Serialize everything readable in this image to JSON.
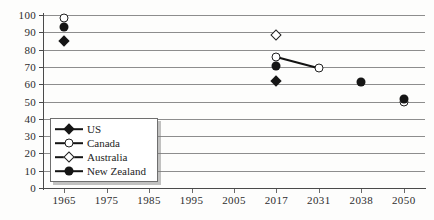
{
  "chart_data": {
    "type": "scatter",
    "title": "",
    "xlabel": "",
    "ylabel": "",
    "grid": true,
    "legend_position": "inside-lower-left",
    "categories": [
      "1965",
      "1975",
      "1985",
      "1995",
      "2005",
      "2017",
      "2031",
      "2038",
      "2050"
    ],
    "ylim": [
      0,
      100
    ],
    "yticks": [
      0,
      10,
      20,
      30,
      40,
      50,
      60,
      70,
      80,
      90,
      100
    ],
    "ytick_labels": [
      "0",
      "10",
      "20",
      "30",
      "40",
      "50",
      "60",
      "70",
      "80",
      "90",
      "100"
    ],
    "series": [
      {
        "name": "US",
        "marker": "filled-diamond",
        "points": [
          {
            "x": "1965",
            "y": 85
          },
          {
            "x": "2017",
            "y": 62
          }
        ]
      },
      {
        "name": "Canada",
        "marker": "open-circle",
        "connected": true,
        "points": [
          {
            "x": "1965",
            "y": 98
          },
          {
            "x": "2017",
            "y": 76
          },
          {
            "x": "2031",
            "y": 69.5
          },
          {
            "x": "2050",
            "y": 50
          }
        ]
      },
      {
        "name": "Australia",
        "marker": "open-diamond",
        "points": [
          {
            "x": "2017",
            "y": 88.5
          }
        ]
      },
      {
        "name": "New Zealand",
        "marker": "filled-circle",
        "points": [
          {
            "x": "1965",
            "y": 93
          },
          {
            "x": "2017",
            "y": 70.5
          },
          {
            "x": "2038",
            "y": 61
          },
          {
            "x": "2050",
            "y": 51.5
          }
        ]
      }
    ]
  },
  "legend": {
    "items": [
      {
        "label": "US",
        "marker": "filled-diamond"
      },
      {
        "label": "Canada",
        "marker": "open-circle"
      },
      {
        "label": "Australia",
        "marker": "open-diamond"
      },
      {
        "label": "New Zealand",
        "marker": "filled-circle"
      }
    ]
  }
}
